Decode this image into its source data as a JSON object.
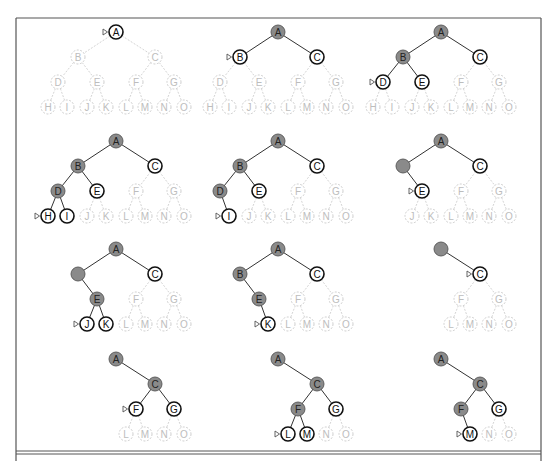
{
  "figure": {
    "colors": {
      "visited_fill": "#8a8a8a",
      "frontier_stroke": "#111111",
      "unexplored_stroke": "#c8c8c8",
      "unexplored_text": "#bdbdbd",
      "edge_active": "#333333",
      "edge_inactive": "#cfcfcf",
      "pointer": "#555555",
      "border": "#555555"
    },
    "tree": {
      "nodes": [
        "A",
        "B",
        "C",
        "D",
        "E",
        "F",
        "G",
        "H",
        "I",
        "J",
        "K",
        "L",
        "M",
        "N",
        "O"
      ],
      "edges": [
        [
          "A",
          "B"
        ],
        [
          "A",
          "C"
        ],
        [
          "B",
          "D"
        ],
        [
          "B",
          "E"
        ],
        [
          "C",
          "F"
        ],
        [
          "C",
          "G"
        ],
        [
          "D",
          "H"
        ],
        [
          "D",
          "I"
        ],
        [
          "E",
          "J"
        ],
        [
          "E",
          "K"
        ],
        [
          "F",
          "L"
        ],
        [
          "F",
          "M"
        ],
        [
          "G",
          "N"
        ],
        [
          "G",
          "O"
        ]
      ]
    },
    "panels": [
      {
        "step": 1,
        "visited": [],
        "frontier": [
          "A"
        ],
        "removed": [],
        "current": "A"
      },
      {
        "step": 2,
        "visited": [
          "A"
        ],
        "frontier": [
          "B",
          "C"
        ],
        "removed": [],
        "current": "B"
      },
      {
        "step": 3,
        "visited": [
          "A",
          "B"
        ],
        "frontier": [
          "C",
          "D",
          "E"
        ],
        "removed": [],
        "current": "D"
      },
      {
        "step": 4,
        "visited": [
          "A",
          "B",
          "D"
        ],
        "frontier": [
          "C",
          "E",
          "H",
          "I"
        ],
        "removed": [],
        "current": "H"
      },
      {
        "step": 5,
        "visited": [
          "A",
          "B",
          "D"
        ],
        "frontier": [
          "C",
          "E",
          "I"
        ],
        "removed": [
          "H"
        ],
        "current": "I"
      },
      {
        "step": 6,
        "visited": [
          "A",
          "B"
        ],
        "frontier": [
          "C",
          "E"
        ],
        "removed": [
          "D",
          "H",
          "I"
        ],
        "current": "E",
        "blank": [
          "B"
        ]
      },
      {
        "step": 7,
        "visited": [
          "A",
          "B",
          "E"
        ],
        "frontier": [
          "C",
          "J",
          "K"
        ],
        "removed": [
          "D",
          "H",
          "I"
        ],
        "current": "J",
        "blank": [
          "B"
        ]
      },
      {
        "step": 8,
        "visited": [
          "A",
          "B",
          "E"
        ],
        "frontier": [
          "C",
          "K"
        ],
        "removed": [
          "D",
          "H",
          "I",
          "J"
        ],
        "current": "K"
      },
      {
        "step": 9,
        "visited": [
          "A"
        ],
        "frontier": [
          "C"
        ],
        "removed": [
          "B",
          "D",
          "E",
          "H",
          "I",
          "J",
          "K"
        ],
        "current": "C",
        "blank": [
          "A"
        ]
      },
      {
        "step": 10,
        "visited": [
          "A",
          "C"
        ],
        "frontier": [
          "F",
          "G"
        ],
        "removed": [
          "B",
          "D",
          "E",
          "H",
          "I",
          "J",
          "K"
        ],
        "current": "F"
      },
      {
        "step": 11,
        "visited": [
          "A",
          "C",
          "F"
        ],
        "frontier": [
          "G",
          "L",
          "M"
        ],
        "removed": [
          "B",
          "D",
          "E",
          "H",
          "I",
          "J",
          "K"
        ],
        "current": "L"
      },
      {
        "step": 12,
        "visited": [
          "A",
          "C",
          "F"
        ],
        "frontier": [
          "G",
          "M"
        ],
        "removed": [
          "B",
          "D",
          "E",
          "H",
          "I",
          "J",
          "K",
          "L"
        ],
        "current": "M"
      }
    ]
  }
}
